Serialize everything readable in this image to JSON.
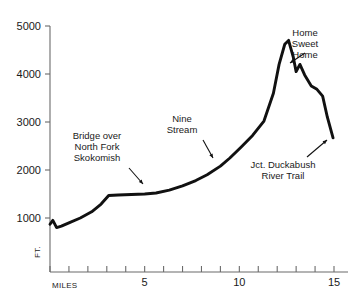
{
  "chart_data": {
    "type": "line",
    "title": "",
    "xlabel": "MILES",
    "ylabel": "FT.",
    "xlim": [
      0,
      15.6
    ],
    "ylim": [
      0,
      5200
    ],
    "grid": false,
    "legend": null,
    "x_ticks_major": [
      5,
      10,
      15
    ],
    "x_ticks_minor": [
      0,
      1,
      2,
      3,
      4,
      5,
      6,
      7,
      8,
      9,
      10,
      11,
      12,
      13,
      14,
      15
    ],
    "y_ticks": [
      1000,
      2000,
      3000,
      4000,
      5000
    ],
    "x_tick_labels": [
      "5",
      "10",
      "15"
    ],
    "y_tick_labels": [
      "1000",
      "2000",
      "3000",
      "4000",
      "5000"
    ],
    "series": [
      {
        "name": "Elevation profile",
        "x": [
          0.0,
          0.15,
          0.35,
          0.6,
          1.0,
          1.6,
          2.2,
          2.7,
          3.1,
          3.6,
          4.3,
          5.0,
          5.6,
          6.3,
          7.0,
          7.7,
          8.3,
          9.0,
          9.5,
          10.1,
          10.7,
          11.3,
          11.8,
          12.1,
          12.4,
          12.6,
          12.85,
          13.0,
          13.2,
          13.45,
          13.8,
          14.1,
          14.4,
          14.65,
          14.95
        ],
        "y": [
          870,
          950,
          800,
          830,
          900,
          1000,
          1130,
          1290,
          1470,
          1480,
          1490,
          1500,
          1520,
          1580,
          1670,
          1780,
          1900,
          2080,
          2250,
          2480,
          2720,
          3020,
          3600,
          4200,
          4620,
          4700,
          4350,
          4050,
          4200,
          3980,
          3750,
          3680,
          3540,
          3100,
          2670
        ]
      }
    ],
    "annotations": [
      {
        "id": "bridge",
        "text": "Bridge over\nNorth Fork\nSkokomish",
        "x_mile": 5.6,
        "y_ft": 1520,
        "label_x": 97,
        "label_y": 131,
        "arrow_from_x": 129,
        "arrow_from_y": 168,
        "arrow_to_x": 143,
        "arrow_to_y": 184
      },
      {
        "id": "nine-stream",
        "text": "Nine\nStream",
        "x_mile": 9.0,
        "y_ft": 2080,
        "label_x": 182,
        "label_y": 114,
        "arrow_from_x": 203,
        "arrow_from_y": 140,
        "arrow_to_x": 213,
        "arrow_to_y": 158
      },
      {
        "id": "home-sweet-home",
        "text": "Home\nSweet\nHome",
        "x_mile": 13.2,
        "y_ft": 4200,
        "label_x": 305,
        "label_y": 28,
        "arrow_from_x": 305,
        "arrow_from_y": 53,
        "arrow_to_x": 290,
        "arrow_to_y": 63
      },
      {
        "id": "jct-duckabush",
        "text": "Jct. Duckabush\nRiver Trail",
        "x_mile": 14.7,
        "y_ft": 2900,
        "label_x": 283,
        "label_y": 160,
        "arrow_from_x": 307,
        "arrow_from_y": 157,
        "arrow_to_x": 327,
        "arrow_to_y": 140
      }
    ],
    "line_color": "#111111",
    "axis_color": "#6b6b6b"
  },
  "axis": {
    "y_unit": "FT.",
    "x_unit": "MILES"
  }
}
